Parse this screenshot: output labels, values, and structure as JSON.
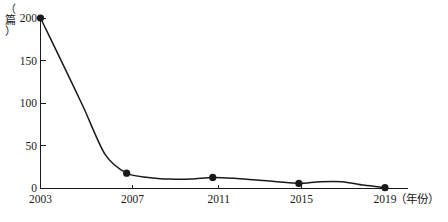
{
  "chart_data": {
    "type": "line",
    "title": "",
    "subtitle": "",
    "xlabel": "（年份）",
    "ylabel": "（篇）",
    "ylabel_chars": [
      "（",
      "篇",
      "）"
    ],
    "x": [
      2003,
      2004,
      2005,
      2006,
      2007,
      2008,
      2009,
      2010,
      2011,
      2012,
      2013,
      2014,
      2015,
      2016,
      2017,
      2018,
      2019
    ],
    "values": [
      200,
      148,
      95,
      40,
      18,
      13,
      11,
      11,
      13,
      12,
      10,
      8,
      6,
      8,
      8,
      4,
      1
    ],
    "marked_points": [
      {
        "x": 2003,
        "y": 200
      },
      {
        "x": 2007,
        "y": 18
      },
      {
        "x": 2011,
        "y": 13
      },
      {
        "x": 2015,
        "y": 6
      },
      {
        "x": 2019,
        "y": 1
      }
    ],
    "xticks": [
      2003,
      2007,
      2011,
      2015,
      2019
    ],
    "xtick_labels": [
      "2003",
      "2007",
      "2011",
      "2015",
      "2019"
    ],
    "yticks": [
      0,
      50,
      100,
      150,
      200
    ],
    "ytick_labels": [
      "0",
      "50",
      "100",
      "150",
      "200"
    ],
    "xlim": [
      2003,
      2019
    ],
    "ylim": [
      0,
      200
    ],
    "grid": false,
    "legend": null,
    "series_color": "#1a1a1a",
    "marker": "circle"
  },
  "axis": {
    "x_unit_label": "（年份）",
    "y_unit_label": "（篇）"
  }
}
